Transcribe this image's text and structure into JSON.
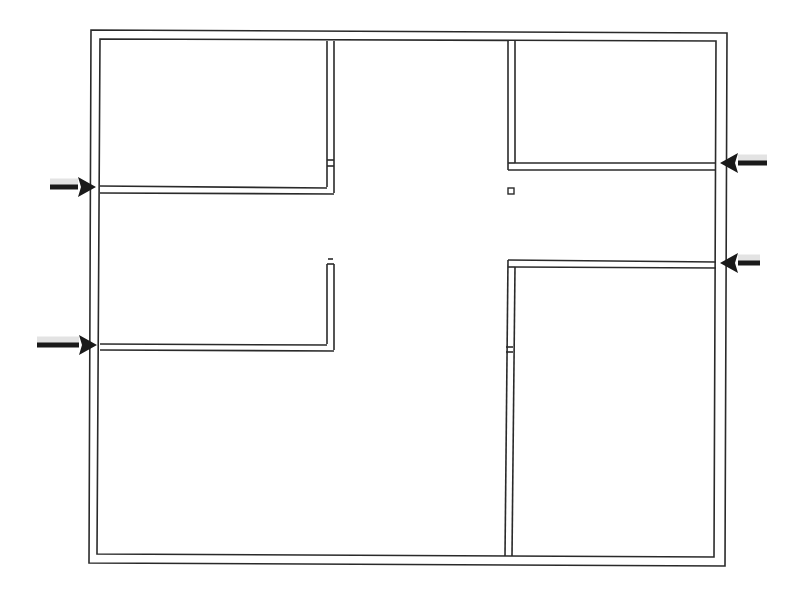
{
  "diagram": {
    "type": "floor-plan",
    "title": "",
    "stroke_color": "#2a2a2a",
    "arrow_color": "#1a1a1a",
    "background": "#ffffff",
    "outer_wall": {
      "outer": [
        [
          91,
          30
        ],
        [
          727,
          33
        ],
        [
          725,
          566
        ],
        [
          89,
          563
        ]
      ],
      "inner": [
        [
          100,
          39
        ],
        [
          716,
          41
        ],
        [
          714,
          557
        ],
        [
          97,
          554
        ]
      ]
    },
    "walls": [
      {
        "name": "left-vertical-upper",
        "lines": [
          [
            [
              327,
              41
            ],
            [
              327,
              187
            ]
          ],
          [
            [
              334,
              41
            ],
            [
              334,
              193
            ]
          ]
        ]
      },
      {
        "name": "left-horizontal-upper",
        "lines": [
          [
            [
              100,
              186
            ],
            [
              327,
              188
            ]
          ],
          [
            [
              100,
              193
            ],
            [
              334,
              194
            ]
          ]
        ]
      },
      {
        "name": "left-vertical-lower",
        "lines": [
          [
            [
              327,
              264
            ],
            [
              327,
              344
            ]
          ],
          [
            [
              334,
              264
            ],
            [
              334,
              350
            ]
          ]
        ],
        "cap": [
          [
            327,
            264
          ],
          [
            334,
            264
          ]
        ],
        "tick": [
          [
            328,
            259
          ],
          [
            333,
            259
          ]
        ]
      },
      {
        "name": "left-horizontal-lower",
        "lines": [
          [
            [
              100,
              344
            ],
            [
              327,
              345
            ]
          ],
          [
            [
              100,
              350
            ],
            [
              334,
              351
            ]
          ]
        ]
      },
      {
        "name": "right-vertical-upper",
        "lines": [
          [
            [
              508,
              41
            ],
            [
              508,
              170
            ]
          ],
          [
            [
              515,
              41
            ],
            [
              515,
              163
            ]
          ]
        ]
      },
      {
        "name": "right-horizontal-upper",
        "lines": [
          [
            [
              515,
              163
            ],
            [
              716,
              163
            ]
          ],
          [
            [
              508,
              170
            ],
            [
              716,
              170
            ]
          ]
        ]
      },
      {
        "name": "right-horizontal-lower",
        "lines": [
          [
            [
              508,
              260
            ],
            [
              716,
              262
            ]
          ],
          [
            [
              515,
              267
            ],
            [
              716,
              268
            ]
          ]
        ]
      },
      {
        "name": "right-vertical-lower",
        "lines": [
          [
            [
              508,
              260
            ],
            [
              505,
              556
            ]
          ],
          [
            [
              515,
              267
            ],
            [
              512,
              556
            ]
          ]
        ],
        "joint_y": 347
      }
    ],
    "column": {
      "x": 508,
      "y": 188,
      "size": 6
    },
    "arrows": [
      {
        "name": "arrow-left-upper",
        "from": [
          50,
          187
        ],
        "to": [
          96,
          187
        ],
        "direction": "right"
      },
      {
        "name": "arrow-left-lower",
        "from": [
          37,
          345
        ],
        "to": [
          97,
          345
        ],
        "direction": "right"
      },
      {
        "name": "arrow-right-upper",
        "from": [
          767,
          163
        ],
        "to": [
          720,
          163
        ],
        "direction": "left"
      },
      {
        "name": "arrow-right-lower",
        "from": [
          760,
          263
        ],
        "to": [
          720,
          263
        ],
        "direction": "left"
      }
    ],
    "rooms": [
      {
        "name": "room-top-left"
      },
      {
        "name": "room-top-right"
      },
      {
        "name": "central-corridor"
      },
      {
        "name": "room-bottom-left"
      },
      {
        "name": "room-bottom-right"
      }
    ]
  }
}
